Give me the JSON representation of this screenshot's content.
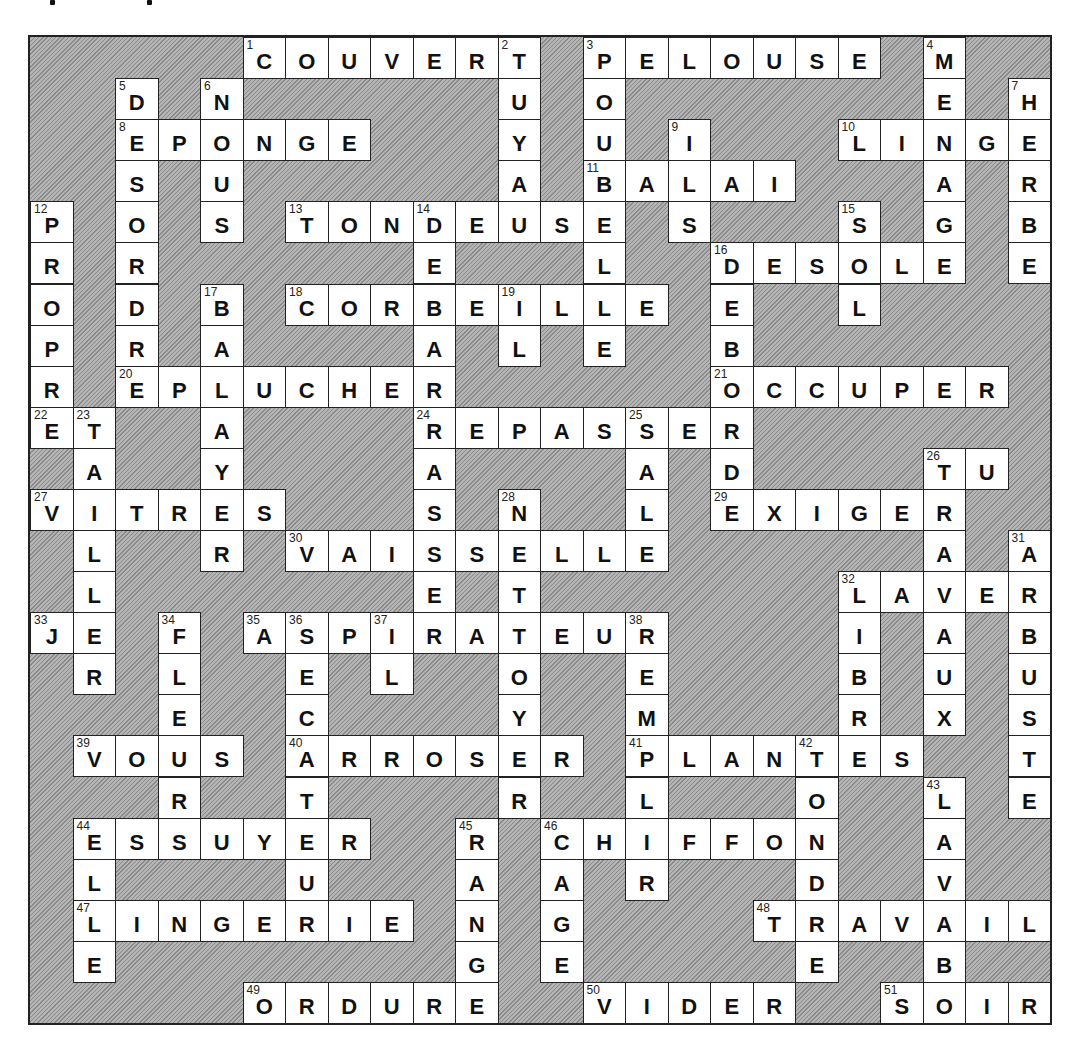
{
  "puzzle": {
    "type": "crossword",
    "language": "fr",
    "rows": 24,
    "cols": 24,
    "colors": {
      "block": "#9a9a9a",
      "cell": "#ffffff",
      "border": "#222222",
      "text": "#111111"
    },
    "across": [
      {
        "num": 1,
        "word": "COUVERT",
        "row": 0,
        "col": 5
      },
      {
        "num": 3,
        "word": "PELOUSE",
        "row": 0,
        "col": 13
      },
      {
        "num": 8,
        "word": "EPONGE",
        "row": 2,
        "col": 2
      },
      {
        "num": 10,
        "word": "LINGE",
        "row": 2,
        "col": 19
      },
      {
        "num": 11,
        "word": "BALAI",
        "row": 3,
        "col": 13
      },
      {
        "num": 13,
        "word": "TONDEUSE",
        "row": 4,
        "col": 6
      },
      {
        "num": 16,
        "word": "DESOLE",
        "row": 5,
        "col": 16
      },
      {
        "num": 18,
        "word": "CORBEILLE",
        "row": 6,
        "col": 6
      },
      {
        "num": 20,
        "word": "EPLUCHER",
        "row": 8,
        "col": 2
      },
      {
        "num": 21,
        "word": "OCCUPER",
        "row": 8,
        "col": 16
      },
      {
        "num": 22,
        "word": "ET",
        "row": 9,
        "col": 0
      },
      {
        "num": 24,
        "word": "REPASSER",
        "row": 9,
        "col": 9
      },
      {
        "num": 26,
        "word": "TU",
        "row": 10,
        "col": 21
      },
      {
        "num": 27,
        "word": "VITRES",
        "row": 11,
        "col": 0
      },
      {
        "num": 29,
        "word": "EXIGER",
        "row": 11,
        "col": 16
      },
      {
        "num": 30,
        "word": "VAISSELLE",
        "row": 12,
        "col": 6
      },
      {
        "num": 32,
        "word": "LAVER",
        "row": 13,
        "col": 19
      },
      {
        "num": 33,
        "word": "JE",
        "row": 14,
        "col": 0
      },
      {
        "num": 35,
        "word": "ASPIRATEUR",
        "row": 14,
        "col": 5
      },
      {
        "num": 39,
        "word": "VOUS",
        "row": 17,
        "col": 1
      },
      {
        "num": 40,
        "word": "ARROSER",
        "row": 17,
        "col": 6
      },
      {
        "num": 41,
        "word": "PLANTES",
        "row": 17,
        "col": 14
      },
      {
        "num": 44,
        "word": "ESSUYER",
        "row": 19,
        "col": 1
      },
      {
        "num": 46,
        "word": "CHIFFON",
        "row": 19,
        "col": 12
      },
      {
        "num": 47,
        "word": "LINGERIE",
        "row": 21,
        "col": 1
      },
      {
        "num": 48,
        "word": "TRAVAIL",
        "row": 21,
        "col": 17
      },
      {
        "num": 49,
        "word": "ORDURE",
        "row": 23,
        "col": 5
      },
      {
        "num": 50,
        "word": "VIDER",
        "row": 23,
        "col": 13
      },
      {
        "num": 51,
        "word": "SOIR",
        "row": 23,
        "col": 20
      }
    ],
    "down": [
      {
        "num": 2,
        "word": "TUYAU",
        "row": 0,
        "col": 11
      },
      {
        "num": 3,
        "word": "POUBELLE",
        "row": 0,
        "col": 13
      },
      {
        "num": 4,
        "word": "MENAGE",
        "row": 0,
        "col": 21
      },
      {
        "num": 5,
        "word": "DESORDRE",
        "row": 1,
        "col": 2
      },
      {
        "num": 6,
        "word": "NOUS",
        "row": 1,
        "col": 4
      },
      {
        "num": 7,
        "word": "HERBE",
        "row": 1,
        "col": 23
      },
      {
        "num": 9,
        "word": "ILS",
        "row": 2,
        "col": 15
      },
      {
        "num": 12,
        "word": "PROPRE",
        "row": 4,
        "col": 0
      },
      {
        "num": 14,
        "word": "DEBARRASSE",
        "row": 4,
        "col": 9
      },
      {
        "num": 15,
        "word": "SOL",
        "row": 4,
        "col": 19
      },
      {
        "num": 16,
        "word": "DEBORD",
        "row": 5,
        "col": 16
      },
      {
        "num": 17,
        "word": "BALAYER",
        "row": 6,
        "col": 4
      },
      {
        "num": 19,
        "word": "IL",
        "row": 6,
        "col": 11
      },
      {
        "num": 23,
        "word": "TAILLER",
        "row": 9,
        "col": 1
      },
      {
        "num": 25,
        "word": "SALE",
        "row": 9,
        "col": 14
      },
      {
        "num": 26,
        "word": "TRAVAUX",
        "row": 10,
        "col": 21
      },
      {
        "num": 28,
        "word": "NETTOYER",
        "row": 11,
        "col": 11
      },
      {
        "num": 31,
        "word": "ARBUSTE",
        "row": 12,
        "col": 23
      },
      {
        "num": 32,
        "word": "LIBRE",
        "row": 13,
        "col": 19
      },
      {
        "num": 34,
        "word": "FLEUR",
        "row": 14,
        "col": 3
      },
      {
        "num": 36,
        "word": "SECATEUR",
        "row": 14,
        "col": 6
      },
      {
        "num": 37,
        "word": "IL",
        "row": 14,
        "col": 8
      },
      {
        "num": 38,
        "word": "REMPLIR",
        "row": 14,
        "col": 14
      },
      {
        "num": 42,
        "word": "TONDRE",
        "row": 17,
        "col": 18
      },
      {
        "num": 43,
        "word": "LAVABO",
        "row": 18,
        "col": 21
      },
      {
        "num": 44,
        "word": "ELLE",
        "row": 19,
        "col": 1
      },
      {
        "num": 45,
        "word": "RANGE",
        "row": 19,
        "col": 10
      },
      {
        "num": 46,
        "word": "CAGE",
        "row": 19,
        "col": 12
      }
    ]
  }
}
